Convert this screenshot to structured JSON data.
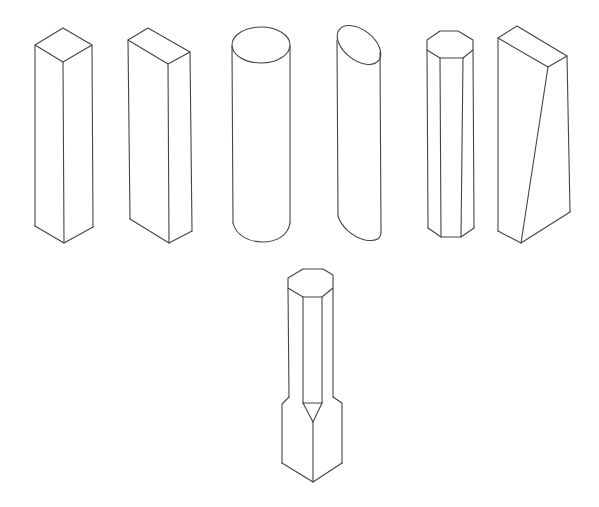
{
  "diagram": {
    "stroke_color": "#444444",
    "background": "#ffffff",
    "shapes": [
      {
        "id": "square-prism",
        "label": "Square prism"
      },
      {
        "id": "rectangular-prism",
        "label": "Rectangular prism"
      },
      {
        "id": "cylinder",
        "label": "Cylinder"
      },
      {
        "id": "oblique-cut-cylinder",
        "label": "Cylinder with inclined top"
      },
      {
        "id": "octagonal-prism",
        "label": "Octagonal prism"
      },
      {
        "id": "wedge-prism",
        "label": "Prism with inclined face"
      },
      {
        "id": "octagonal-stepped-prism",
        "label": "Octagonal prism transitioning to square base"
      }
    ]
  }
}
